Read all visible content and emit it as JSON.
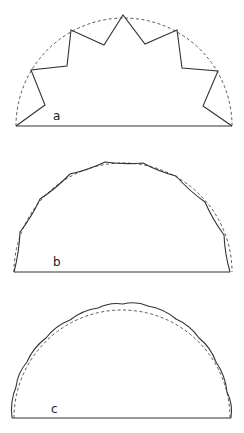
{
  "figures": [
    {
      "id": "a",
      "label": "a",
      "label_pos": [
        53,
        120
      ],
      "description": "Star-shaped zigzag polygon inscribed in dashed semicircle",
      "arc": {
        "cx": 124,
        "cy": 126,
        "r": 108
      },
      "polyline": [
        [
          16,
          126
        ],
        [
          45,
          105
        ],
        [
          31,
          70
        ],
        [
          67,
          66
        ],
        [
          71,
          30
        ],
        [
          104,
          45
        ],
        [
          123,
          15
        ],
        [
          145,
          44
        ],
        [
          177,
          30
        ],
        [
          182,
          68
        ],
        [
          218,
          71
        ],
        [
          203,
          106
        ],
        [
          232,
          126
        ]
      ]
    },
    {
      "id": "b",
      "label": "b",
      "label_pos": [
        53,
        266
      ],
      "description": "Polygon with slightly concave edges close to dashed semicircle",
      "arc": {
        "cx": 123,
        "cy": 272,
        "r": 109
      },
      "polyline": [
        [
          14,
          272
        ],
        [
          20,
          232
        ],
        [
          40,
          199
        ],
        [
          70,
          174
        ],
        [
          105,
          162
        ],
        [
          143,
          163
        ],
        [
          176,
          176
        ],
        [
          205,
          202
        ],
        [
          224,
          235
        ],
        [
          230,
          272
        ]
      ]
    },
    {
      "id": "c",
      "label": "c",
      "label_pos": [
        51,
        413
      ],
      "description": "Scalloped outward arcs around dashed semicircle",
      "arc": {
        "cx": 122,
        "cy": 418,
        "r": 108
      },
      "cusps": [
        [
          12,
          418
        ],
        [
          16,
          387
        ],
        [
          27,
          362
        ],
        [
          46,
          338
        ],
        [
          70,
          320
        ],
        [
          98,
          308
        ],
        [
          123,
          304
        ],
        [
          148,
          306
        ],
        [
          176,
          319
        ],
        [
          199,
          338
        ],
        [
          216,
          362
        ],
        [
          227,
          392
        ],
        [
          231,
          418
        ]
      ]
    }
  ]
}
